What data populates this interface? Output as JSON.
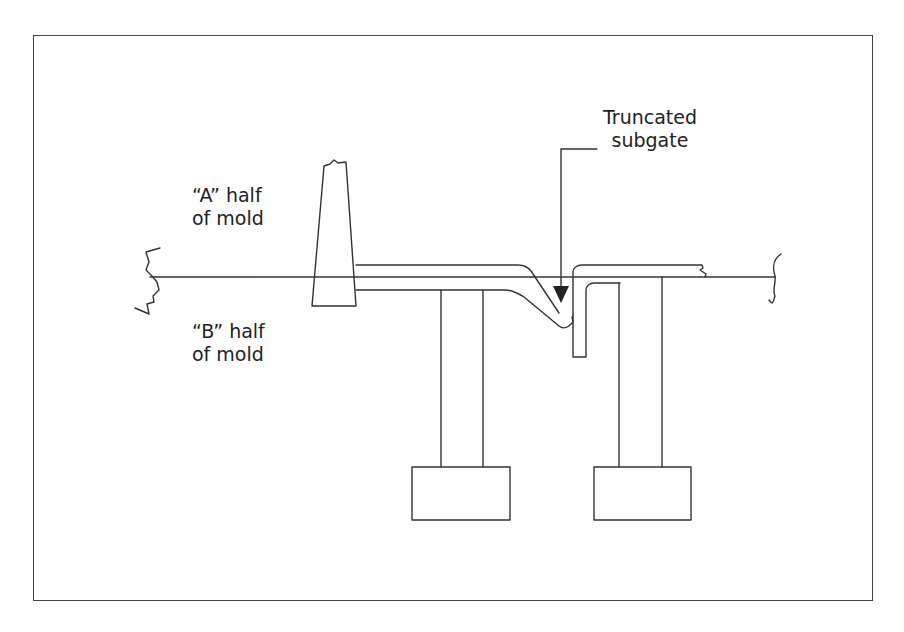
{
  "figure": {
    "type": "mold cross-section diagram",
    "labels": {
      "a_half_line1": "“A” half",
      "a_half_line2": "of mold",
      "b_half_line1": "“B” half",
      "b_half_line2": "of mold",
      "callout_line1": "Truncated",
      "callout_line2": "subgate"
    },
    "components": [
      "parting-line",
      "sprue",
      "runner",
      "truncated-subgate",
      "part-cavity",
      "ejector-pin-left",
      "ejector-pin-right",
      "ejector-plate-left",
      "ejector-plate-right"
    ],
    "colors": {
      "stroke": "#333333",
      "background": "#ffffff"
    }
  }
}
